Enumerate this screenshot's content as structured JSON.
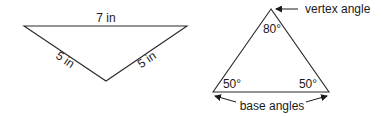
{
  "left_triangle": {
    "top_side_label": "7 in",
    "left_side_label": "5 in",
    "right_side_label": "5 in"
  },
  "right_triangle": {
    "vertex_angle_value": "80°",
    "base_angle_left_value": "50°",
    "base_angle_right_value": "50°",
    "vertex_angle_caption": "vertex angle",
    "base_angles_caption": "base angles"
  }
}
